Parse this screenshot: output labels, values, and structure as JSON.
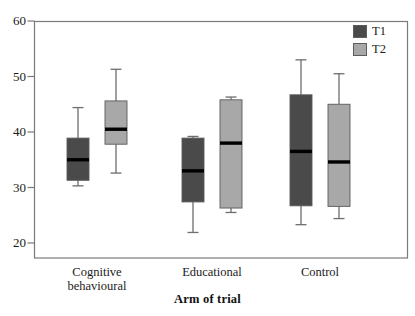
{
  "chart_data": {
    "type": "box",
    "title": "",
    "xlabel": "Arm of trial",
    "ylabel": "",
    "categories": [
      "Cognitive\nbehavioural",
      "Educational",
      "Control"
    ],
    "ylim": [
      18,
      60
    ],
    "yticks": [
      20,
      30,
      40,
      50,
      60
    ],
    "ytick_labels": [
      "20",
      "30",
      "40",
      "50",
      "60"
    ],
    "grid": false,
    "legend_position": "top-right",
    "series": [
      {
        "name": "T1",
        "color": "#4a4a4a",
        "boxes": [
          {
            "category": "Cognitive behavioural",
            "whisker_low": 30.3,
            "q1": 31.3,
            "median": 35.0,
            "q3": 38.9,
            "whisker_high": 44.4
          },
          {
            "category": "Educational",
            "whisker_low": 21.9,
            "q1": 27.4,
            "median": 33.0,
            "q3": 38.9,
            "whisker_high": 39.2
          },
          {
            "category": "Control",
            "whisker_low": 23.3,
            "q1": 26.7,
            "median": 36.5,
            "q3": 46.7,
            "whisker_high": 53.0
          }
        ]
      },
      {
        "name": "T2",
        "color": "#a8a8a8",
        "boxes": [
          {
            "category": "Cognitive behavioural",
            "whisker_low": 32.6,
            "q1": 37.8,
            "median": 40.5,
            "q3": 45.6,
            "whisker_high": 51.3
          },
          {
            "category": "Educational",
            "whisker_low": 25.5,
            "q1": 26.3,
            "median": 38.0,
            "q3": 45.8,
            "whisker_high": 46.3
          },
          {
            "category": "Control",
            "whisker_low": 24.4,
            "q1": 26.6,
            "median": 34.6,
            "q3": 45.0,
            "whisker_high": 50.5
          }
        ]
      }
    ]
  },
  "legend": {
    "items": [
      {
        "label": "T1",
        "color": "#4a4a4a"
      },
      {
        "label": "T2",
        "color": "#a8a8a8"
      }
    ]
  },
  "axes": {
    "x_title": "Arm of trial",
    "y_tick_labels": [
      "60",
      "50",
      "40",
      "30",
      "20"
    ],
    "x_category_labels": [
      "Cognitive\nbehavioural",
      "Educational",
      "Control"
    ]
  }
}
